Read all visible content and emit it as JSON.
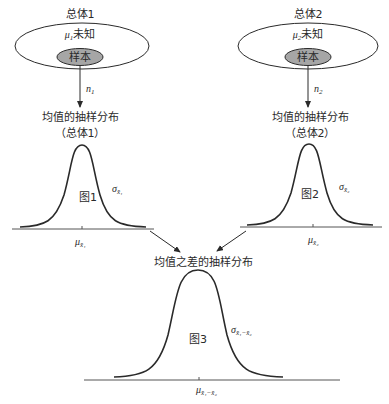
{
  "population1": {
    "title": "总体1",
    "unknown_mean": "μ₁未知",
    "mu_symbol": "μ",
    "mu_sub": "1",
    "unknown_label": "未知",
    "sample_label": "样本",
    "sample_size": "n",
    "sample_size_sub": "1"
  },
  "population2": {
    "title": "总体2",
    "mu_symbol": "μ",
    "mu_sub": "2",
    "unknown_label": "未知",
    "sample_label": "样本",
    "sample_size": "n",
    "sample_size_sub": "2"
  },
  "dist1": {
    "title": "均值的抽样分布",
    "subtitle": "（总体1）",
    "figure_label": "图1",
    "sigma": "σ",
    "sigma_sub": "x̄₁",
    "mean": "μ",
    "mean_sub": "x̄₁"
  },
  "dist2": {
    "title": "均值的抽样分布",
    "subtitle": "（总体2）",
    "figure_label": "图2",
    "sigma": "σ",
    "sigma_sub": "x̄₂",
    "mean": "μ",
    "mean_sub": "x̄₂"
  },
  "dist3": {
    "title": "均值之差的抽样分布",
    "figure_label": "图3",
    "sigma": "σ",
    "sigma_sub": "x̄₁−x̄₂",
    "mean": "μ",
    "mean_sub": "x̄₁−x̄₂"
  },
  "colors": {
    "line": "#2a2a2a",
    "sample_fill": "#a6a6a6",
    "axis": "#555555"
  }
}
